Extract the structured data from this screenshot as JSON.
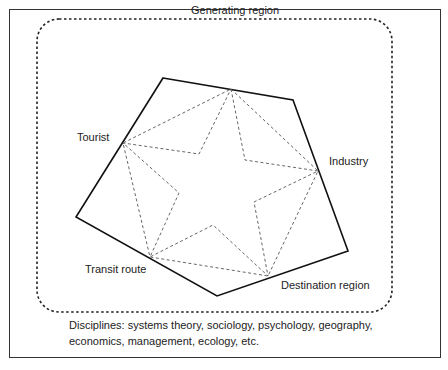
{
  "diagram": {
    "nodes": {
      "generating": "Generating region",
      "industry": "Industry",
      "destination": "Destination region",
      "transit": "Transit route",
      "tourist": "Tourist"
    },
    "caption": {
      "line1": "Disciplines: systems theory, sociology, psychology, geography,",
      "line2": "economics, management, ecology, etc."
    },
    "colors": {
      "frame": "#333333",
      "pentagon": "#111111",
      "dashed": "#555555",
      "text": "#222222"
    }
  }
}
